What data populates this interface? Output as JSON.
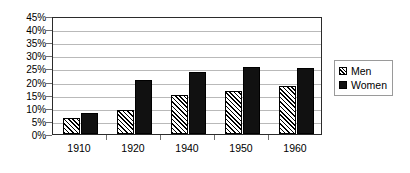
{
  "chart_data": {
    "type": "bar",
    "title": "",
    "subtitle": "",
    "xlabel": "",
    "ylabel": "",
    "categories": [
      "1910",
      "1920",
      "1940",
      "1950",
      "1960"
    ],
    "series": [
      {
        "name": "Men",
        "values": [
          6,
          9,
          15,
          16.5,
          18.5
        ],
        "swatch": "hatch-diagonal",
        "color": "#ffffff"
      },
      {
        "name": "Women",
        "values": [
          8,
          20.5,
          23.5,
          25.5,
          25
        ],
        "swatch": "solid",
        "color": "#111111"
      }
    ],
    "ylim": [
      0,
      45
    ],
    "ytick_step": 5,
    "ytick_labels": [
      "0%",
      "5%",
      "10%",
      "15%",
      "20%",
      "25%",
      "30%",
      "35%",
      "40%",
      "45%"
    ],
    "ytick_values": [
      0,
      5,
      10,
      15,
      20,
      25,
      30,
      35,
      40,
      45
    ],
    "value_suffix": "%",
    "grid": true,
    "grid_axis": "y",
    "grid_color": "#b9b9b9",
    "legend_position": "right",
    "plot_border_color": "#2b2b2b",
    "background_color": "#ffffff"
  },
  "legend": {
    "entries": [
      {
        "label": "Men"
      },
      {
        "label": "Women"
      }
    ]
  }
}
